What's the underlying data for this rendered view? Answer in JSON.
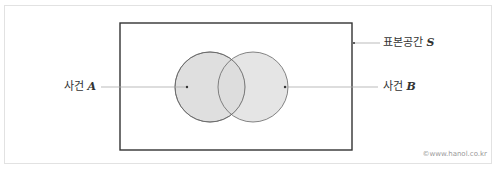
{
  "diagram": {
    "type": "venn",
    "sample_space": {
      "label": "표본공간",
      "symbol": "S"
    },
    "events": [
      {
        "label": "사건",
        "symbol": "A"
      },
      {
        "label": "사건",
        "symbol": "B"
      }
    ],
    "colors": {
      "fill": "#dcdcdc",
      "stroke": "#555555",
      "box": "#333333",
      "leader": "#aaaaaa"
    }
  },
  "credit": "©www.hanol.co.kr"
}
